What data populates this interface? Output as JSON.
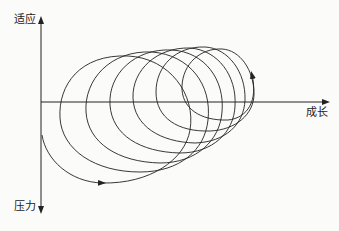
{
  "diagram": {
    "axes": {
      "y_top_label": "适应",
      "y_bottom_label": "压力",
      "x_label": "成长"
    },
    "loop_count": 6,
    "colors": {
      "stroke": "#222222",
      "background": "#fbfbfa"
    }
  }
}
